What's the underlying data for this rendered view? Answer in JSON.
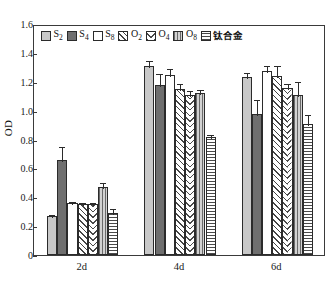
{
  "chart_data": {
    "type": "bar",
    "title": "",
    "xlabel": "",
    "ylabel": "OD",
    "ylim": [
      0,
      1.6
    ],
    "yticks": [
      "0",
      "0.2",
      "0.4",
      "0.6",
      "0.8",
      "1.0",
      "1.2",
      "1.4",
      "1.6"
    ],
    "ytick_values": [
      0,
      0.2,
      0.4,
      0.6,
      0.8,
      1.0,
      1.2,
      1.4,
      1.6
    ],
    "grid": false,
    "legend_position": "top-inside",
    "categories": [
      "2d",
      "4d",
      "6d"
    ],
    "series": [
      {
        "name": "S2",
        "label_base": "S",
        "label_sub": "2",
        "pattern": "solid-light",
        "color": "#c8c8c8",
        "values": [
          0.27,
          1.31,
          1.23
        ],
        "errors": [
          0.02,
          0.045,
          0.045
        ]
      },
      {
        "name": "S4",
        "label_base": "S",
        "label_sub": "4",
        "pattern": "solid-dark",
        "color": "#6f6f6f",
        "values": [
          0.66,
          1.18,
          0.975
        ],
        "errors": [
          0.105,
          0.085,
          0.115
        ]
      },
      {
        "name": "S8",
        "label_base": "S",
        "label_sub": "8",
        "pattern": "white",
        "color": "#ffffff",
        "values": [
          0.36,
          1.245,
          1.275
        ],
        "errors": [
          0.02,
          0.06,
          0.05
        ]
      },
      {
        "name": "O2",
        "label_base": "O",
        "label_sub": "2",
        "pattern": "diagonal-hatch",
        "color": "#ffffff",
        "values": [
          0.355,
          1.15,
          1.24
        ],
        "errors": [
          0.018,
          0.045,
          0.085
        ]
      },
      {
        "name": "O4",
        "label_base": "O",
        "label_sub": "4",
        "pattern": "chevron",
        "color": "#ffffff",
        "values": [
          0.355,
          1.11,
          1.155
        ],
        "errors": [
          0.018,
          0.04,
          0.04
        ]
      },
      {
        "name": "O8",
        "label_base": "O",
        "label_sub": "8",
        "pattern": "vertical-lines",
        "color": "#d2d2d2",
        "values": [
          0.47,
          1.12,
          1.11
        ],
        "errors": [
          0.045,
          0.04,
          0.1
        ]
      },
      {
        "name": "钛合金",
        "label_base": "钛合金",
        "label_sub": "",
        "pattern": "horizontal-lines",
        "color": "#ffffff",
        "values": [
          0.29,
          0.82,
          0.91
        ],
        "errors": [
          0.045,
          0.025,
          0.075
        ]
      }
    ]
  },
  "axes": {
    "y_label": "OD",
    "x_tick_labels": [
      "2d",
      "4d",
      "6d"
    ]
  }
}
